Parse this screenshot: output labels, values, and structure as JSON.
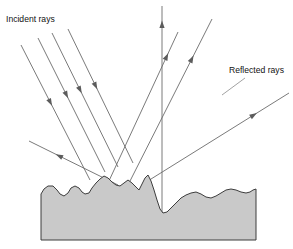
{
  "figure": {
    "type": "optics-ray-diagram",
    "width": 293,
    "height": 249,
    "background_color": "#ffffff"
  },
  "labels": {
    "incident": "Incident rays",
    "reflected": "Reflected rays"
  },
  "colors": {
    "ray_stroke": "#6b6b6b",
    "arrow_fill": "#5c5c5c",
    "surface_fill": "#c9c9c9",
    "surface_stroke": "#3d3d3d",
    "leader_stroke": "#8a8a8a",
    "text": "#111111"
  },
  "label_positions": {
    "incident": {
      "x": 6,
      "y": 22
    },
    "reflected": {
      "x": 229,
      "y": 73
    }
  },
  "leaders": [
    {
      "name": "reflected-label-leader",
      "x1": 245,
      "y1": 78,
      "x2": 222,
      "y2": 95
    }
  ],
  "incident_rays": [
    {
      "name": "incident-ray-1",
      "x1": 21,
      "y1": 45,
      "x2": 90,
      "y2": 180,
      "arrow_t": 0.45
    },
    {
      "name": "incident-ray-2",
      "x1": 38,
      "y1": 38,
      "x2": 105,
      "y2": 172,
      "arrow_t": 0.45
    },
    {
      "name": "incident-ray-3",
      "x1": 52,
      "y1": 33,
      "x2": 118,
      "y2": 167,
      "arrow_t": 0.45
    },
    {
      "name": "incident-ray-4",
      "x1": 68,
      "y1": 29,
      "x2": 133,
      "y2": 163,
      "arrow_t": 0.45
    }
  ],
  "reflected_rays": [
    {
      "name": "reflected-ray-vertical",
      "x1": 162,
      "y1": 213,
      "x2": 162,
      "y2": 6,
      "arrow_t": 0.93
    },
    {
      "name": "reflected-ray-steep-left",
      "x1": 108,
      "y1": 183,
      "x2": 178,
      "y2": 32,
      "arrow_t": 0.86
    },
    {
      "name": "reflected-ray-steep-right",
      "x1": 128,
      "y1": 185,
      "x2": 212,
      "y2": 19,
      "arrow_t": 0.78
    },
    {
      "name": "reflected-ray-shallow-right",
      "x1": 143,
      "y1": 184,
      "x2": 289,
      "y2": 93,
      "arrow_t": 0.78
    },
    {
      "name": "reflected-ray-left",
      "x1": 118,
      "y1": 185,
      "x2": 29,
      "y2": 141,
      "arrow_t": 0.7
    }
  ],
  "surface": {
    "name": "rough-surface-block",
    "left_edge_x": 41,
    "right_edge_x": 256,
    "bottom_y": 240,
    "profile_points": "41,194 44,189 48,186 53,186 57,190 60,194 64,196 68,193 71,188 75,186 79,188 82,192 85,194 89,193 92,188 96,183 100,179 104,176 108,178 112,182 116,185 120,186 124,183 128,180 132,183 136,187 139,190 142,184 145,178 148,175 151,181 154,190 157,200 160,209 163,213 167,212 171,208 176,203 181,198 186,195 191,193 196,192 201,194 206,197 211,198 216,196 221,193 226,190 231,189 236,190 241,192 246,193 250,192 253,190 256,189"
  },
  "chart_data": {
    "type": "diagram",
    "incident_ray_count": 4,
    "reflected_ray_count": 5,
    "annotations": [
      "Incident rays",
      "Reflected rays"
    ]
  }
}
